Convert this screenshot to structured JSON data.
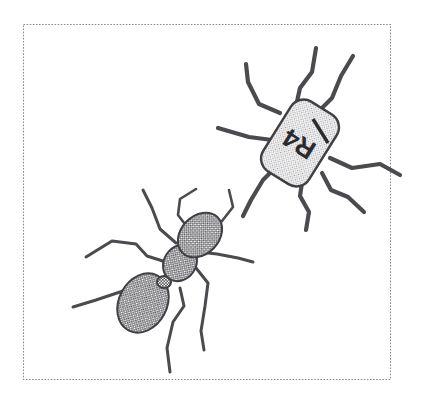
{
  "canvas": {
    "width": 434,
    "height": 393,
    "background_color": "#ffffff",
    "title": "Ant and labelled robot inside dotted frame"
  },
  "frame": {
    "name": "dotted-border-frame",
    "x": 23,
    "y": 24,
    "width": 368,
    "height": 356,
    "stroke_color": "#8a8a92",
    "style": "dotted"
  },
  "colors": {
    "ink": "#4b4b4f",
    "outline": "#3f3f44",
    "ant_fill": "#9b9b9e",
    "robot_fill": "#d2d2d4",
    "frame": "#8a8a92",
    "label_text": "#2a2a2e"
  },
  "robot": {
    "name": "robot-r4",
    "label": "R4",
    "has_bar_marking": true,
    "body_shape": "rounded-rectangle",
    "leg_count": 6,
    "fill_color": "#d2d2d4",
    "rotation_degrees": -58,
    "center_x": 300,
    "center_y": 143
  },
  "ant": {
    "name": "ant",
    "segments": [
      "head",
      "thorax",
      "petiole",
      "abdomen"
    ],
    "leg_count": 6,
    "antenna_count": 2,
    "fill_color": "#9b9b9e",
    "center_x": 175,
    "center_y": 270
  }
}
